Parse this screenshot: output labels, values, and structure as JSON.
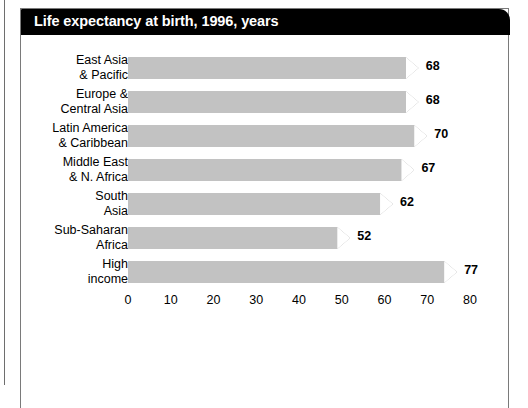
{
  "panel": {
    "title": "Life expectancy at birth, 1996, years"
  },
  "chart_data": {
    "type": "bar",
    "orientation": "horizontal",
    "title": "Life expectancy at birth, 1996, years",
    "xlabel": "",
    "ylabel": "",
    "xlim": [
      0,
      80
    ],
    "xticks": [
      0,
      10,
      20,
      30,
      40,
      50,
      60,
      70,
      80
    ],
    "grid": false,
    "legend": null,
    "bar_color": "#c2c2c2",
    "categories": [
      "East Asia\n& Pacific",
      "Europe &\nCentral Asia",
      "Latin America\n& Caribbean",
      "Middle East\n& N. Africa",
      "South\nAsia",
      "Sub-Saharan\nAfrica",
      "High\nincome"
    ],
    "values": [
      68,
      68,
      70,
      67,
      62,
      52,
      77
    ],
    "data_labels": [
      "68",
      "68",
      "70",
      "67",
      "62",
      "52",
      "77"
    ]
  }
}
